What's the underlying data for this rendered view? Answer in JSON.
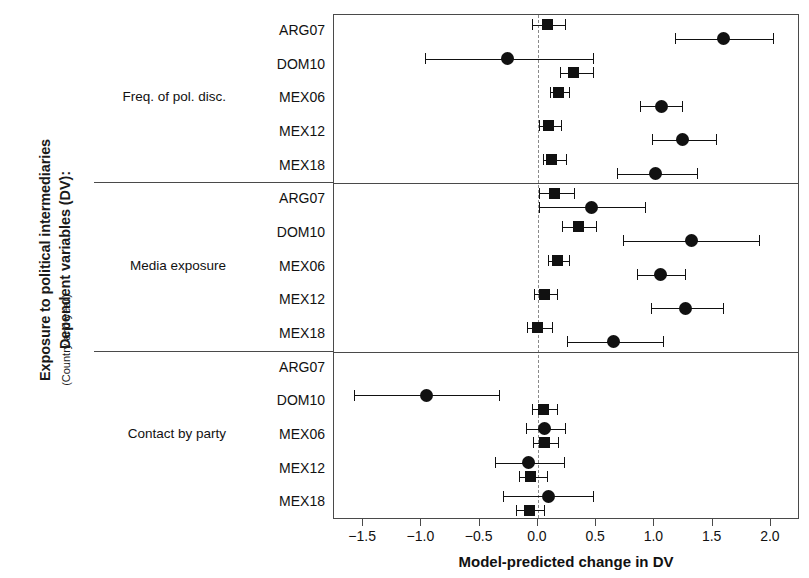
{
  "axis_titles": {
    "y_line1": "Dependent variables (DV):",
    "y_line2": "Exposure to political intermediaries",
    "y_line3": "(Country and year)",
    "x_title": "Model-predicted change in DV"
  },
  "chart_data": {
    "type": "scatter",
    "title": "",
    "xlabel": "Model-predicted change in DV",
    "ylabel": "Dependent variables (DV): Exposure to political intermediaries (Country and year)",
    "xlim": [
      -1.75,
      2.25
    ],
    "xticks": [
      -1.5,
      -1.0,
      -0.5,
      0.0,
      0.5,
      1.0,
      1.5,
      2.0
    ],
    "xticklabels": [
      "−1.5",
      "−1.0",
      "−0.5",
      "0.0",
      "0.5",
      "1.0",
      "1.5",
      "2.0"
    ],
    "grid": false,
    "zero_reference_line": 0.0,
    "legend_position": "none",
    "marker_shapes": [
      "square",
      "circle"
    ],
    "groups": [
      {
        "label": "Freq. of pol. disc.",
        "rows": [
          {
            "label": "ARG07",
            "points": [
              {
                "shape": "square",
                "value": 0.08,
                "ci_low": -0.05,
                "ci_high": 0.23
              },
              {
                "shape": "circle",
                "value": 1.59,
                "ci_low": 1.18,
                "ci_high": 2.02
              }
            ]
          },
          {
            "label": "DOM10",
            "points": [
              {
                "shape": "circle",
                "value": -0.26,
                "ci_low": -0.97,
                "ci_high": 0.47
              },
              {
                "shape": "square",
                "value": 0.31,
                "ci_low": 0.19,
                "ci_high": 0.47
              }
            ]
          },
          {
            "label": "MEX06",
            "points": [
              {
                "shape": "square",
                "value": 0.18,
                "ci_low": 0.1,
                "ci_high": 0.27
              },
              {
                "shape": "circle",
                "value": 1.06,
                "ci_low": 0.88,
                "ci_high": 1.24
              }
            ]
          },
          {
            "label": "MEX12",
            "points": [
              {
                "shape": "square",
                "value": 0.09,
                "ci_low": 0.01,
                "ci_high": 0.2
              },
              {
                "shape": "circle",
                "value": 1.24,
                "ci_low": 0.98,
                "ci_high": 1.53
              }
            ]
          },
          {
            "label": "MEX18",
            "points": [
              {
                "shape": "square",
                "value": 0.12,
                "ci_low": 0.04,
                "ci_high": 0.24
              },
              {
                "shape": "circle",
                "value": 1.01,
                "ci_low": 0.68,
                "ci_high": 1.37
              }
            ]
          }
        ]
      },
      {
        "label": "Media exposure",
        "rows": [
          {
            "label": "ARG07",
            "points": [
              {
                "shape": "square",
                "value": 0.14,
                "ci_low": 0.01,
                "ci_high": 0.31
              },
              {
                "shape": "circle",
                "value": 0.46,
                "ci_low": 0.01,
                "ci_high": 0.92
              }
            ]
          },
          {
            "label": "DOM10",
            "points": [
              {
                "shape": "square",
                "value": 0.35,
                "ci_low": 0.21,
                "ci_high": 0.5
              },
              {
                "shape": "circle",
                "value": 1.32,
                "ci_low": 0.73,
                "ci_high": 1.9
              }
            ]
          },
          {
            "label": "MEX06",
            "points": [
              {
                "shape": "square",
                "value": 0.17,
                "ci_low": 0.09,
                "ci_high": 0.27
              },
              {
                "shape": "circle",
                "value": 1.05,
                "ci_low": 0.85,
                "ci_high": 1.26
              }
            ]
          },
          {
            "label": "MEX12",
            "points": [
              {
                "shape": "square",
                "value": 0.06,
                "ci_low": -0.03,
                "ci_high": 0.16
              },
              {
                "shape": "circle",
                "value": 1.27,
                "ci_low": 0.97,
                "ci_high": 1.59
              }
            ]
          },
          {
            "label": "MEX18",
            "points": [
              {
                "shape": "square",
                "value": 0.0,
                "ci_low": -0.09,
                "ci_high": 0.12
              },
              {
                "shape": "circle",
                "value": 0.65,
                "ci_low": 0.25,
                "ci_high": 1.07
              }
            ]
          }
        ]
      },
      {
        "label": "Contact by party",
        "rows": [
          {
            "label": "ARG07",
            "points": []
          },
          {
            "label": "DOM10",
            "points": [
              {
                "shape": "circle",
                "value": -0.96,
                "ci_low": -1.58,
                "ci_high": -0.33
              },
              {
                "shape": "square",
                "value": 0.05,
                "ci_low": -0.05,
                "ci_high": 0.16
              }
            ]
          },
          {
            "label": "MEX06",
            "points": [
              {
                "shape": "circle",
                "value": 0.06,
                "ci_low": -0.1,
                "ci_high": 0.23
              },
              {
                "shape": "square",
                "value": 0.06,
                "ci_low": -0.04,
                "ci_high": 0.17
              }
            ]
          },
          {
            "label": "MEX12",
            "points": [
              {
                "shape": "circle",
                "value": -0.08,
                "ci_low": -0.37,
                "ci_high": 0.22
              },
              {
                "shape": "square",
                "value": -0.06,
                "ci_low": -0.16,
                "ci_high": 0.08
              }
            ]
          },
          {
            "label": "MEX18",
            "points": [
              {
                "shape": "circle",
                "value": 0.09,
                "ci_low": -0.3,
                "ci_high": 0.47
              },
              {
                "shape": "square",
                "value": -0.07,
                "ci_low": -0.19,
                "ci_high": 0.05
              }
            ]
          }
        ]
      }
    ]
  },
  "colors": {
    "marker": "#111111",
    "frame": "#4a4a4a",
    "zero_line": "#8a8a8a",
    "text": "#111111",
    "background": "#ffffff"
  }
}
